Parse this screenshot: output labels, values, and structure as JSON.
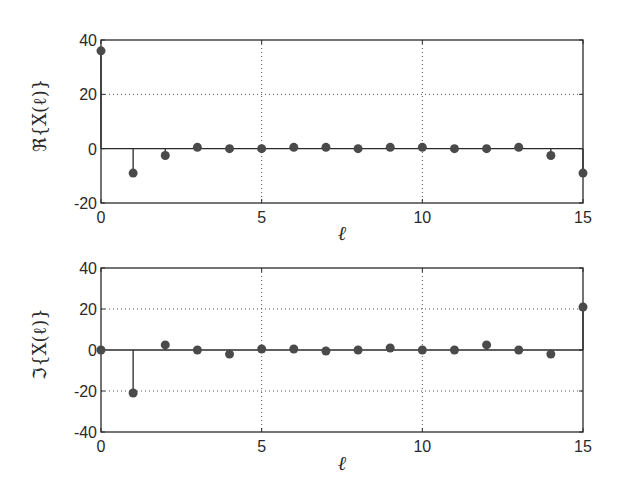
{
  "chart_data": [
    {
      "type": "stem",
      "ylabel": "ℜ{X(ℓ)}",
      "xlabel": "ℓ",
      "x": [
        0,
        1,
        2,
        3,
        4,
        5,
        6,
        7,
        8,
        9,
        10,
        11,
        12,
        13,
        14,
        15
      ],
      "values": [
        36,
        -9,
        -2.5,
        0.5,
        0,
        0,
        0.5,
        0.5,
        0,
        0.5,
        0.5,
        0,
        0,
        0.5,
        -2.5,
        -9
      ],
      "xlim": [
        0,
        15
      ],
      "ylim": [
        -20,
        40
      ],
      "xticks": [
        0,
        5,
        10,
        15
      ],
      "yticks": [
        -20,
        0,
        20,
        40
      ],
      "grid": true
    },
    {
      "type": "stem",
      "ylabel": "ℑ{X(ℓ)}",
      "xlabel": "ℓ",
      "x": [
        0,
        1,
        2,
        3,
        4,
        5,
        6,
        7,
        8,
        9,
        10,
        11,
        12,
        13,
        14,
        15
      ],
      "values": [
        0,
        -21,
        2.5,
        0,
        -2,
        0.5,
        0.5,
        -0.5,
        0,
        1,
        0,
        0,
        2.5,
        0,
        -2,
        21
      ],
      "xlim": [
        0,
        15
      ],
      "ylim": [
        -40,
        40
      ],
      "xticks": [
        0,
        5,
        10,
        15
      ],
      "yticks": [
        -40,
        -20,
        0,
        20,
        40
      ],
      "grid": true
    }
  ],
  "colors": {
    "axis": "#2a2a2a",
    "marker": "#4a4a4a",
    "grid": "#555555"
  }
}
